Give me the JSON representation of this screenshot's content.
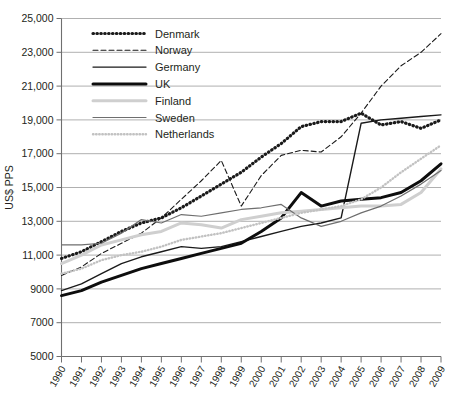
{
  "chart_data": {
    "type": "line",
    "title": "",
    "xlabel": "",
    "ylabel": "US$ PPS",
    "ylim": [
      5000,
      25000
    ],
    "ytick_step": 2000,
    "ytick_labels": [
      "25,000",
      "23,000",
      "21,000",
      "19,000",
      "17,000",
      "15,000",
      "13,000",
      "11,000",
      "9000",
      "7000",
      "5000"
    ],
    "ytick_values": [
      25000,
      23000,
      21000,
      19000,
      17000,
      15000,
      13000,
      11000,
      9000,
      7000,
      5000
    ],
    "grid": true,
    "grid_axis": "y",
    "legend_position": "top-left-inside",
    "categories": [
      "1990",
      "1991",
      "1992",
      "1993",
      "1994",
      "1995",
      "1996",
      "1997",
      "1998",
      "1999",
      "2000",
      "2001",
      "2002",
      "2003",
      "2004",
      "2005",
      "2006",
      "2007",
      "2008",
      "2009"
    ],
    "x": [
      1990,
      1991,
      1992,
      1993,
      1994,
      1995,
      1996,
      1997,
      1998,
      1999,
      2000,
      2001,
      2002,
      2003,
      2004,
      2005,
      2006,
      2007,
      2008,
      2009
    ],
    "series": [
      {
        "name": "Denmark",
        "style": "dotted",
        "color": "#1a1a1a",
        "width": 3.2,
        "dash": "0.5,3.4",
        "values": [
          10800,
          11200,
          11800,
          12400,
          12900,
          13200,
          13800,
          14500,
          15200,
          15900,
          16800,
          17600,
          18600,
          18900,
          18900,
          19400,
          18700,
          18900,
          18500,
          19000
        ]
      },
      {
        "name": "Norway",
        "style": "dashed",
        "color": "#1a1a1a",
        "width": 1.1,
        "dash": "5,3",
        "values": [
          9800,
          10300,
          11100,
          11700,
          12300,
          13200,
          14300,
          15400,
          16600,
          13900,
          15700,
          16900,
          17200,
          17100,
          18000,
          19400,
          21000,
          22200,
          23000,
          24100
        ]
      },
      {
        "name": "Germany",
        "style": "solid",
        "color": "#1a1a1a",
        "width": 1.4,
        "dash": "none",
        "values": [
          8900,
          9300,
          9900,
          10500,
          10900,
          11200,
          11500,
          11400,
          11500,
          11800,
          12100,
          12400,
          12700,
          12900,
          13200,
          18800,
          19000,
          19100,
          19200,
          19300
        ]
      },
      {
        "name": "UK",
        "style": "solid",
        "color": "#0d0d0d",
        "width": 3.0,
        "dash": "none",
        "values": [
          8600,
          8900,
          9400,
          9800,
          10200,
          10500,
          10800,
          11100,
          11400,
          11700,
          12400,
          13200,
          14700,
          13900,
          14200,
          14300,
          14400,
          14700,
          15400,
          16400
        ]
      },
      {
        "name": "Finland",
        "style": "solid",
        "color": "#cfcfcf",
        "width": 3.0,
        "dash": "none",
        "values": [
          10500,
          11000,
          11600,
          11900,
          12200,
          12400,
          12900,
          12800,
          12600,
          13100,
          13300,
          13500,
          13600,
          13700,
          13800,
          13900,
          13900,
          14000,
          14700,
          16100
        ]
      },
      {
        "name": "Sweden",
        "style": "solid",
        "color": "#6e6e6e",
        "width": 1.2,
        "dash": "none",
        "values": [
          11600,
          11600,
          11700,
          12300,
          13100,
          12900,
          13400,
          13300,
          13500,
          13700,
          13800,
          14000,
          13200,
          12700,
          13000,
          13500,
          13900,
          14500,
          15200,
          16000
        ]
      },
      {
        "name": "Netherlands",
        "style": "dotted",
        "color": "#c2c2c2",
        "width": 2.4,
        "dash": "0.5,2.6",
        "values": [
          9900,
          10200,
          10700,
          11000,
          11200,
          11500,
          11900,
          12100,
          12300,
          12600,
          12900,
          13200,
          13500,
          13700,
          13900,
          14300,
          15000,
          15900,
          16700,
          17500
        ]
      }
    ]
  },
  "legend": {
    "items": [
      {
        "label": "Denmark"
      },
      {
        "label": "Norway"
      },
      {
        "label": "Germany"
      },
      {
        "label": "UK"
      },
      {
        "label": "Finland"
      },
      {
        "label": "Sweden"
      },
      {
        "label": "Netherlands"
      }
    ]
  },
  "colors": {
    "grid": "#a7a7a7",
    "axis": "#6f6f6f",
    "text": "#231f20",
    "background": "#ffffff"
  }
}
